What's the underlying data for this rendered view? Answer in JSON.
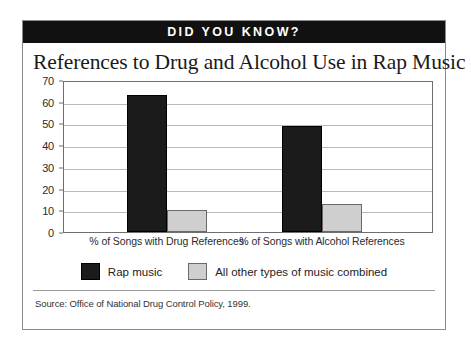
{
  "banner": {
    "text": "DID YOU KNOW?"
  },
  "title": "References to Drug and Alcohol Use in Rap Music",
  "source": "Source:  Office of National Drug Control Policy, 1999.",
  "colors": {
    "banner_background": "#111111",
    "banner_text": "#ffffff",
    "series_rap": "#1b1b1b",
    "series_other": "#cfcfcf",
    "grid": "#b9b9b9",
    "axis": "#6f6f6f"
  },
  "chart_data": {
    "type": "bar",
    "title": "References to Drug and Alcohol Use in Rap Music",
    "xlabel": "",
    "ylabel": "",
    "ylim": [
      0,
      70
    ],
    "yticks": [
      0,
      10,
      20,
      30,
      40,
      50,
      60,
      70
    ],
    "grid": true,
    "legend_position": "bottom",
    "categories": [
      "% of Songs with Drug References",
      "% of Songs with Alcohol References"
    ],
    "series": [
      {
        "name": "Rap music",
        "values": [
          63,
          49
        ]
      },
      {
        "name": "All other types of music combined",
        "values": [
          10,
          13
        ]
      }
    ]
  }
}
